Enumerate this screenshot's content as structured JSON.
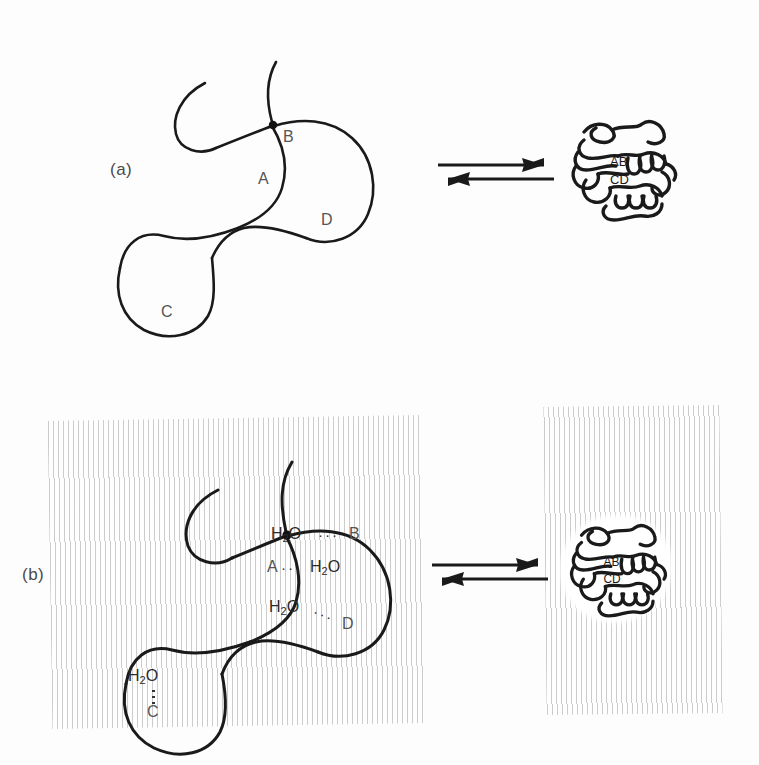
{
  "figure": {
    "background_color": "#fdfdfd",
    "ink_color": "#1a1a1a",
    "hatch_color": "#b9b9b9",
    "width": 759,
    "height": 765
  },
  "panels": [
    {
      "id": "a",
      "letter": "(a)",
      "description": "Unfolded extended polypeptide chain with exposed residues A, B, C, D in the absence of water, in equilibrium with the compact folded globule.",
      "solvent": "none",
      "left_state": {
        "name": "unfolded-chain",
        "residues": [
          "A",
          "B",
          "C",
          "D"
        ]
      },
      "right_state": {
        "name": "folded-globule",
        "core_residues_top": [
          "A",
          "B"
        ],
        "core_residues_bottom": [
          "C",
          "D"
        ]
      },
      "arrow": {
        "type": "equilibrium",
        "forward_label": "",
        "reverse_label": ""
      }
    },
    {
      "id": "b",
      "letter": "(b)",
      "description": "Same chain immersed in water (vertical hatching). Each exposed residue is hydrogen bonded to a water molecule; the folded globule excludes water from its core.",
      "solvent": "water-hatched",
      "left_state": {
        "name": "unfolded-chain-hydrated",
        "residues": [
          "A",
          "B",
          "C",
          "D"
        ],
        "water_contacts": [
          {
            "water": "H2O",
            "residue": "B",
            "bond": "dotted",
            "orientation": "horizontal"
          },
          {
            "water": "H2O",
            "residue": "A",
            "bond": "dotted",
            "orientation": "horizontal"
          },
          {
            "water": "H2O",
            "residue": "D",
            "bond": "dotted",
            "orientation": "diagonal"
          },
          {
            "water": "H2O",
            "residue": "C",
            "bond": "dotted",
            "orientation": "vertical"
          }
        ]
      },
      "right_state": {
        "name": "folded-globule-hydrated",
        "core_residues_top": [
          "A",
          "B"
        ],
        "core_residues_bottom": [
          "C",
          "D"
        ]
      },
      "arrow": {
        "type": "equilibrium",
        "forward_label": "",
        "reverse_label": ""
      }
    }
  ],
  "labels": {
    "residue_a": "A",
    "residue_b": "B",
    "residue_c": "C",
    "residue_d": "D",
    "water": "H",
    "water_sub": "2",
    "water_o": "O",
    "hbond_dots": "···",
    "globule_ab": "AB",
    "globule_cd": "CD",
    "globule_a": "A",
    "globule_b": "B",
    "globule_c": "C",
    "globule_d": "D"
  }
}
